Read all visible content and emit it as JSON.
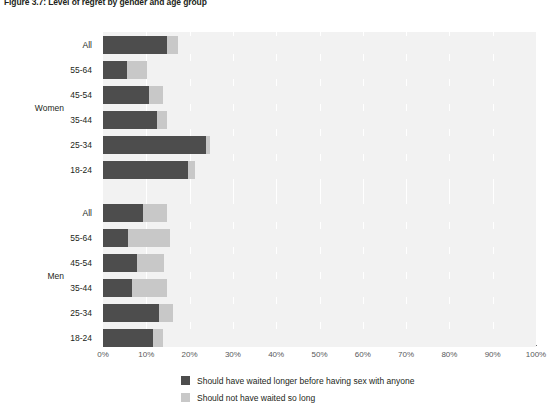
{
  "figure": {
    "title": "Figure 3.7: Level of regret by gender and age group"
  },
  "legend": {
    "items": [
      {
        "label": "Should have waited longer before having sex with anyone",
        "color": "#4d4d4d",
        "swatch_name": "legend-swatch-waited-longer"
      },
      {
        "label": "Should not have waited so long",
        "color": "#c8c8c8",
        "swatch_name": "legend-swatch-not-waited-so-long"
      }
    ]
  },
  "axes": {
    "x_ticks": [
      "0%",
      "10%",
      "20%",
      "30%",
      "40%",
      "50%",
      "60%",
      "70%",
      "80%",
      "90%",
      "100%"
    ],
    "group_labels": [
      "Women",
      "Men"
    ]
  },
  "chart_data": {
    "type": "bar",
    "orientation": "horizontal",
    "stacked": true,
    "title": "Figure 3.7: Level of regret by gender and age group",
    "xlabel": "",
    "ylabel": "",
    "xlim": [
      0,
      100
    ],
    "x_ticks": [
      0,
      10,
      20,
      30,
      40,
      50,
      60,
      70,
      80,
      90,
      100
    ],
    "grid": true,
    "legend_position": "bottom",
    "units": "percent",
    "series": [
      {
        "name": "Should have waited longer before having sex with anyone",
        "color": "#4d4d4d"
      },
      {
        "name": "Should not have waited so long",
        "color": "#c8c8c8"
      },
      {
        "name": "Neither / no regret",
        "color": "#f2f2f2"
      }
    ],
    "groups": [
      {
        "name": "Women",
        "rows": [
          {
            "category": "All",
            "values": [
              14.7,
              2.7,
              82.6
            ]
          },
          {
            "category": "55-64",
            "values": [
              5.5,
              4.6,
              89.9
            ]
          },
          {
            "category": "45-54",
            "values": [
              10.6,
              3.3,
              86.1
            ]
          },
          {
            "category": "35-44",
            "values": [
              12.4,
              2.3,
              85.3
            ]
          },
          {
            "category": "25-34",
            "values": [
              23.8,
              0.9,
              75.3
            ]
          },
          {
            "category": "18-24",
            "values": [
              19.6,
              1.6,
              78.8
            ]
          }
        ]
      },
      {
        "name": "Men",
        "rows": [
          {
            "category": "All",
            "values": [
              9.2,
              5.5,
              85.3
            ]
          },
          {
            "category": "55-64",
            "values": [
              5.8,
              9.6,
              84.6
            ]
          },
          {
            "category": "45-54",
            "values": [
              7.8,
              6.2,
              86.0
            ]
          },
          {
            "category": "35-44",
            "values": [
              6.6,
              8.1,
              85.3
            ]
          },
          {
            "category": "25-34",
            "values": [
              12.9,
              3.2,
              83.9
            ]
          },
          {
            "category": "18-24",
            "values": [
              11.6,
              2.3,
              86.1
            ]
          }
        ]
      }
    ]
  }
}
